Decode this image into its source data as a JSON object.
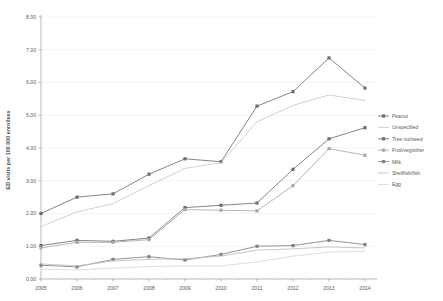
{
  "chart_data": {
    "type": "line",
    "title": "",
    "xlabel": "",
    "ylabel": "ED visits per 100 000 enrollees",
    "x": [
      2005,
      2006,
      2007,
      2008,
      2009,
      2010,
      2011,
      2012,
      2013,
      2014
    ],
    "categories": [
      "2005",
      "2006",
      "2007",
      "2008",
      "2009",
      "2010",
      "2011",
      "2012",
      "2013",
      "2014"
    ],
    "ylim": [
      0.0,
      8.0
    ],
    "ytick_step": 1.0,
    "ytick_labels": [
      "0.00",
      "1.00",
      "2.00",
      "3.00",
      "4.00",
      "5.00",
      "6.00",
      "7.00",
      "8.00"
    ],
    "ytick_values": [
      0.0,
      1.0,
      2.0,
      3.0,
      4.0,
      5.0,
      6.0,
      7.0,
      8.0
    ],
    "grid": true,
    "legend_position": "right",
    "series": [
      {
        "name": "Peanut",
        "marker": "square",
        "color": "#6d6e71",
        "values": [
          2.0,
          2.5,
          2.6,
          3.2,
          3.67,
          3.58,
          5.28,
          5.72,
          6.75,
          5.83
        ]
      },
      {
        "name": "Unspecified",
        "marker": "none",
        "color": "#c8c9cb",
        "values": [
          1.6,
          2.05,
          2.3,
          2.85,
          3.38,
          3.55,
          4.8,
          5.3,
          5.62,
          5.45
        ]
      },
      {
        "name": "Tree nut/seed",
        "marker": "square",
        "color": "#6d6e71",
        "values": [
          1.02,
          1.18,
          1.15,
          1.25,
          2.18,
          2.25,
          2.32,
          3.35,
          4.28,
          4.62
        ]
      },
      {
        "name": "Fruit/veg/other",
        "marker": "square",
        "color": "#a7a9ac",
        "values": [
          0.95,
          1.12,
          1.12,
          1.2,
          2.12,
          2.1,
          2.08,
          2.85,
          3.98,
          3.78
        ]
      },
      {
        "name": "Milk",
        "marker": "square",
        "color": "#808285",
        "values": [
          0.42,
          0.37,
          0.6,
          0.68,
          0.58,
          0.75,
          1.0,
          1.02,
          1.18,
          1.05
        ]
      },
      {
        "name": "Shellfish/fish",
        "marker": "none",
        "color": "#bcbec0",
        "values": [
          0.46,
          0.4,
          0.55,
          0.6,
          0.62,
          0.7,
          0.88,
          0.92,
          0.98,
          0.95
        ]
      },
      {
        "name": "Egg",
        "marker": "none",
        "color": "#d5d6d8",
        "values": [
          0.3,
          0.28,
          0.33,
          0.38,
          0.4,
          0.4,
          0.52,
          0.7,
          0.82,
          0.85
        ]
      }
    ]
  },
  "legend": {
    "items": [
      {
        "label": "Peanut"
      },
      {
        "label": "Unspecified"
      },
      {
        "label": "Tree nut/seed"
      },
      {
        "label": "Fruit/veg/other"
      },
      {
        "label": "Milk"
      },
      {
        "label": "Shellfish/fish"
      },
      {
        "label": "Egg"
      }
    ]
  }
}
